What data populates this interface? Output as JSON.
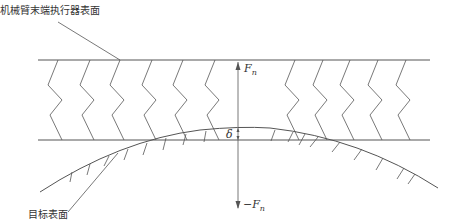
{
  "diagram": {
    "labels": {
      "effector_surface": "机械臂末端执行器表面",
      "target_surface": "目标表面",
      "force_positive": "F",
      "force_positive_sub": "n",
      "force_negative": "−F",
      "force_negative_sub": "n",
      "deformation": "δ"
    },
    "colors": {
      "line": "#555555",
      "text": "#333333",
      "background": "#ffffff"
    },
    "elements": {
      "springs_count": 10,
      "top_plate_y": 60,
      "bottom_plate_y": 140,
      "curve_peak": [
        240,
        128
      ]
    }
  }
}
